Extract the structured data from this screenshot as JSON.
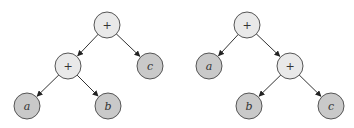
{
  "diagram": {
    "colors": {
      "operator_fill": "#e9e9e9",
      "leaf_fill": "#c9c9c9",
      "stroke": "#555555",
      "edge": "#333333"
    },
    "node_radius": 13,
    "trees": [
      {
        "name": "left-tree",
        "nodes": [
          {
            "id": "root",
            "label": "+",
            "type": "operator",
            "x": 107,
            "y": 25
          },
          {
            "id": "plus",
            "label": "+",
            "type": "operator",
            "x": 68,
            "y": 66
          },
          {
            "id": "c",
            "label": "c",
            "type": "leaf",
            "x": 150,
            "y": 66
          },
          {
            "id": "a",
            "label": "a",
            "type": "leaf",
            "x": 27,
            "y": 106
          },
          {
            "id": "b",
            "label": "b",
            "type": "leaf",
            "x": 108,
            "y": 106
          }
        ],
        "edges": [
          [
            "root",
            "plus"
          ],
          [
            "root",
            "c"
          ],
          [
            "plus",
            "a"
          ],
          [
            "plus",
            "b"
          ]
        ]
      },
      {
        "name": "right-tree",
        "nodes": [
          {
            "id": "root",
            "label": "+",
            "type": "operator",
            "x": 247,
            "y": 25
          },
          {
            "id": "a",
            "label": "a",
            "type": "leaf",
            "x": 209,
            "y": 66
          },
          {
            "id": "plus",
            "label": "+",
            "type": "operator",
            "x": 290,
            "y": 66
          },
          {
            "id": "b",
            "label": "b",
            "type": "leaf",
            "x": 249,
            "y": 106
          },
          {
            "id": "c",
            "label": "c",
            "type": "leaf",
            "x": 331,
            "y": 106
          }
        ],
        "edges": [
          [
            "root",
            "a"
          ],
          [
            "root",
            "plus"
          ],
          [
            "plus",
            "b"
          ],
          [
            "plus",
            "c"
          ]
        ]
      }
    ]
  }
}
